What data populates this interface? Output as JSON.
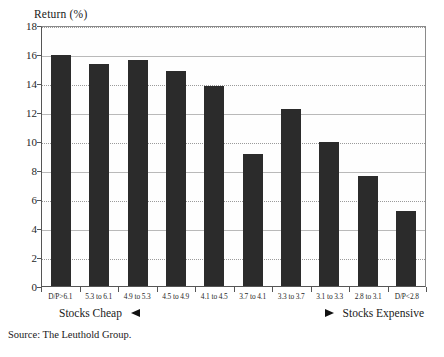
{
  "chart_data": {
    "type": "bar",
    "title": "",
    "ylabel": "Return (%)",
    "xlabel": "",
    "ylim": [
      0,
      18
    ],
    "yticks": [
      0,
      2,
      4,
      6,
      8,
      10,
      12,
      14,
      16,
      18
    ],
    "ytick_labels": [
      "0",
      "2",
      "4",
      "6",
      "8",
      "10",
      "12",
      "14",
      "16",
      "18"
    ],
    "grid": true,
    "legend": "none",
    "categories": [
      "D/P>6.1",
      "5.3 to 6.1",
      "4.9 to 5.3",
      "4.5 to 4.9",
      "4.1 to 4.5",
      "3.7 to 4.1",
      "3.3 to 3.7",
      "3.1 to 3.3",
      "2.8 to 3.1",
      "D/P<2.8"
    ],
    "values": [
      15.9,
      15.3,
      15.6,
      14.8,
      13.8,
      9.1,
      12.2,
      9.9,
      7.6,
      5.2
    ],
    "bar_color": "#2b2b2b",
    "annotations": {
      "left_label": "Stocks Cheap",
      "left_arrow": "arrow-left-icon",
      "right_label": "Stocks Expensive",
      "right_arrow": "arrow-right-icon"
    },
    "source": "Source: The Leuthold Group."
  }
}
